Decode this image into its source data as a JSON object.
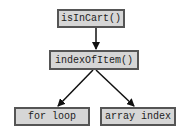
{
  "diagram": {
    "nodes": [
      {
        "id": "root",
        "label": "isInCart()"
      },
      {
        "id": "mid",
        "label": "indexOfItem()"
      },
      {
        "id": "left",
        "label": "for loop"
      },
      {
        "id": "right",
        "label": "array index"
      }
    ],
    "edges": [
      {
        "from": "root",
        "to": "mid"
      },
      {
        "from": "mid",
        "to": "left"
      },
      {
        "from": "mid",
        "to": "right"
      }
    ],
    "colors": {
      "node_fill": "#d6d6d6",
      "node_border": "#555555",
      "edge": "#111111",
      "text": "#222222"
    }
  }
}
